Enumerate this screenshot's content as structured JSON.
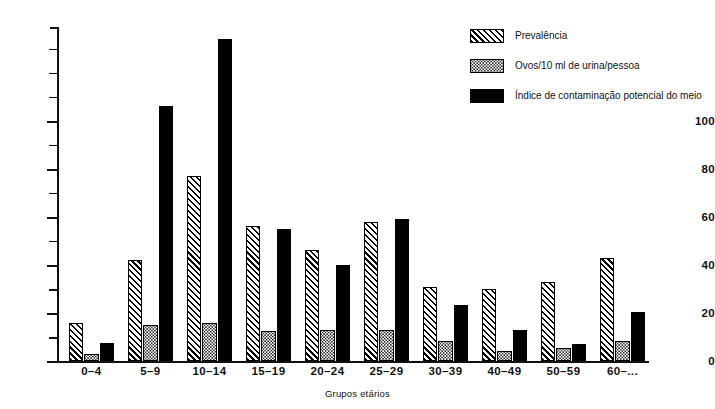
{
  "chart_data": {
    "type": "bar",
    "title": "",
    "xlabel": "Grupos etários",
    "ylabel": "",
    "ylim": [
      0,
      139
    ],
    "grid": false,
    "legend_position": "top-right",
    "categories": [
      "0–4",
      "5–9",
      "10–14",
      "15–19",
      "20–24",
      "25–29",
      "30–39",
      "40–49",
      "50–59",
      "60–..."
    ],
    "y_ticks_major": [
      0,
      20,
      40,
      60,
      80,
      100
    ],
    "y_ticks_minor": [
      10,
      30,
      50,
      70,
      90,
      110,
      120,
      130
    ],
    "y_tick_labels": [
      "0",
      "20",
      "40",
      "60",
      "80",
      "100"
    ],
    "series": [
      {
        "name": "Prevalência",
        "pattern": "diagonal-hatch",
        "values": [
          16,
          42,
          77,
          56,
          46,
          58,
          31,
          30,
          33,
          43
        ]
      },
      {
        "name": "Ovos/10 ml de urina/pessoa",
        "pattern": "stipple-dots",
        "values": [
          3,
          15,
          16,
          12.5,
          13,
          13,
          8.5,
          4,
          5.5,
          8.5
        ]
      },
      {
        "name": "Índice de contaminação potencial do meio",
        "pattern": "solid-black",
        "values": [
          7.5,
          106,
          134,
          55,
          40,
          59,
          23.5,
          13,
          7,
          20.5
        ]
      }
    ]
  },
  "legend": {
    "items": [
      {
        "label": "Prevalência",
        "swatch": "diagonal-hatch"
      },
      {
        "label": "Ovos/10 ml de urina/pessoa",
        "swatch": "stipple-dots"
      },
      {
        "label": "Índice de contaminação potencial do meio",
        "swatch": "solid-black"
      }
    ]
  },
  "colors": {
    "ink": "#111111",
    "series_solid": "#000000",
    "background": "#ffffff"
  }
}
